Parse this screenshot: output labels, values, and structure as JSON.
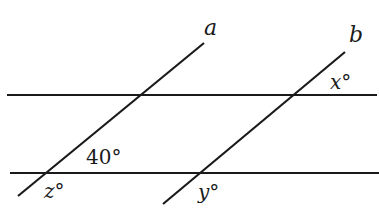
{
  "diagram": {
    "type": "parallel-lines-transversals",
    "horizontal_lines": [
      {
        "id": "upper-parallel",
        "x1": 7,
        "y1": 95,
        "x2": 377,
        "y2": 95
      },
      {
        "id": "lower-parallel",
        "x1": 10,
        "y1": 173,
        "x2": 379,
        "y2": 173
      }
    ],
    "transversals": [
      {
        "id": "a",
        "label": "a",
        "x1": 18,
        "y1": 196,
        "x2": 204,
        "y2": 43
      },
      {
        "id": "b",
        "label": "b",
        "x1": 163,
        "y1": 204,
        "x2": 345,
        "y2": 52
      }
    ],
    "labels": {
      "line_a": "a",
      "line_b": "b",
      "angle_x": "x°",
      "angle_40": "40°",
      "angle_z": "z°",
      "angle_y": "y°"
    },
    "given_angle": 40,
    "unknown_angles": [
      "x",
      "y",
      "z"
    ],
    "color": "#1a1a1a"
  }
}
